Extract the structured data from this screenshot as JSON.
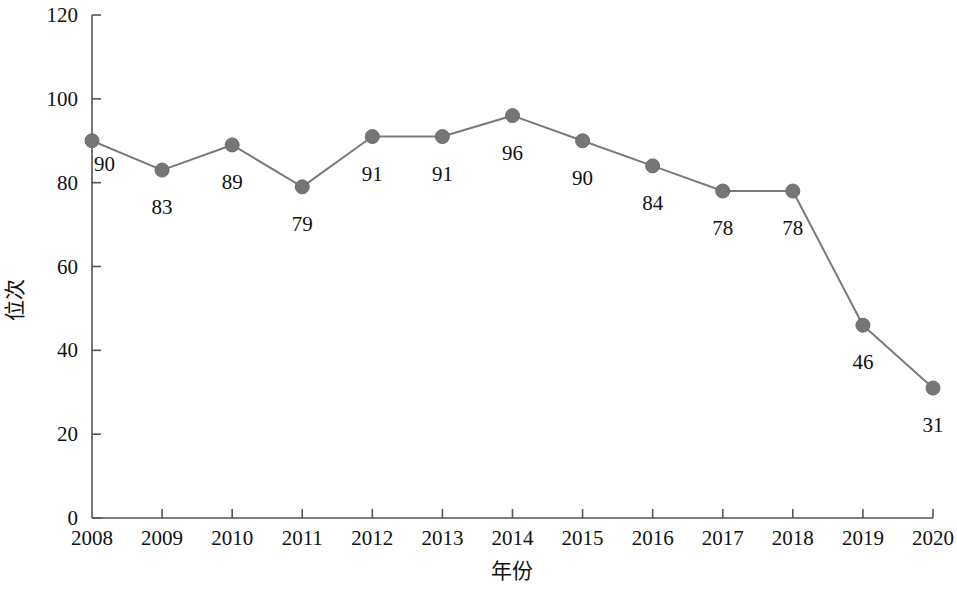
{
  "chart_data": {
    "type": "line",
    "title": "",
    "xlabel": "年份",
    "ylabel": "位次",
    "categories": [
      "2008",
      "2009",
      "2010",
      "2011",
      "2012",
      "2013",
      "2014",
      "2015",
      "2016",
      "2017",
      "2018",
      "2019",
      "2020"
    ],
    "values": [
      90,
      83,
      89,
      79,
      91,
      91,
      96,
      90,
      84,
      78,
      78,
      46,
      31
    ],
    "point_labels": [
      "90",
      "83",
      "89",
      "79",
      "91",
      "91",
      "96",
      "90",
      "84",
      "78",
      "78",
      "46",
      "31"
    ],
    "ylim": [
      0,
      120
    ],
    "y_ticks": [
      "0",
      "20",
      "40",
      "60",
      "80",
      "100",
      "120"
    ],
    "y_tick_values": [
      0,
      20,
      40,
      60,
      80,
      100,
      120
    ],
    "x_ticks": [
      "2008",
      "2009",
      "2010",
      "2011",
      "2012",
      "2013",
      "2014",
      "2015",
      "2016",
      "2017",
      "2018",
      "2019",
      "2020"
    ],
    "grid": false,
    "legend": "none",
    "series": [
      {
        "name": "位次",
        "values": [
          90,
          83,
          89,
          79,
          91,
          91,
          96,
          90,
          84,
          78,
          78,
          46,
          31
        ],
        "color": "#767676",
        "marker": "circle"
      }
    ],
    "colors": {
      "line": "#7a7a7a",
      "marker": "#767676",
      "axis": "#555555",
      "text": "#111111",
      "background": "#ffffff"
    }
  }
}
